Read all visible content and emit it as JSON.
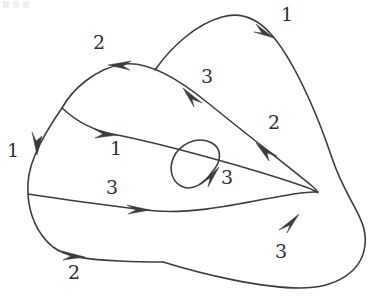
{
  "figure": {
    "kind": "knot-diagram",
    "background_color": "#ffffff",
    "stroke_color": "#3c3c41",
    "label_color": "#2f2f34",
    "width": 374,
    "height": 297
  },
  "labels": [
    {
      "id": "label-top-right-1",
      "text": "1",
      "x": 281,
      "y": 5
    },
    {
      "id": "label-top-left-2",
      "text": "2",
      "x": 93,
      "y": 33
    },
    {
      "id": "label-upper-mid-3",
      "text": "3",
      "x": 201,
      "y": 67
    },
    {
      "id": "label-right-2",
      "text": "2",
      "x": 268,
      "y": 113
    },
    {
      "id": "label-left-1",
      "text": "1",
      "x": 7,
      "y": 141
    },
    {
      "id": "label-mid-1",
      "text": "1",
      "x": 110,
      "y": 139
    },
    {
      "id": "label-loop-3",
      "text": "3",
      "x": 221,
      "y": 168
    },
    {
      "id": "label-lower-mid-3",
      "text": "3",
      "x": 106,
      "y": 178
    },
    {
      "id": "label-bottom-right-3",
      "text": "3",
      "x": 275,
      "y": 242
    },
    {
      "id": "label-bottom-left-2",
      "text": "2",
      "x": 68,
      "y": 263
    }
  ],
  "arcs": [
    {
      "id": "arc-outer-right-lobe",
      "description": "large outer lobe sweeping from the upper middle over the top right, down the right side and around the bottom to the lower middle crossing",
      "label_refs": [
        "label-top-right-1",
        "label-bottom-right-3"
      ]
    },
    {
      "id": "arc-top-left-lobe",
      "description": "upper left lobe from the left crossing over the top apex down to the right turnaround",
      "label_refs": [
        "label-top-left-2",
        "label-upper-mid-3",
        "label-right-2"
      ]
    },
    {
      "id": "arc-left-outer",
      "description": "outer left boundary descending from the top left crossing around the lower left to the bottom",
      "label_refs": [
        "label-left-1",
        "label-bottom-left-2"
      ]
    },
    {
      "id": "arc-middle-chord",
      "description": "inner chord running from the left crossing rightwards to the right turnaround",
      "label_refs": [
        "label-mid-1"
      ]
    },
    {
      "id": "arc-lower-chord",
      "description": "lower chord running from the lower left crossing rightwards to the right turnaround",
      "label_refs": [
        "label-lower-mid-3"
      ]
    },
    {
      "id": "arc-inner-loop",
      "description": "small tilted ellipse loop near the centre of the diagram",
      "label_refs": [
        "label-loop-3"
      ]
    }
  ],
  "arrowheads": [
    {
      "id": "arrowhead-top-right",
      "on_arc": "arc-outer-right-lobe",
      "x": 268,
      "y": 30,
      "direction": "down-right",
      "near_label": "label-top-right-1"
    },
    {
      "id": "arrowhead-top-left",
      "on_arc": "arc-top-left-lobe",
      "x": 117,
      "y": 64,
      "direction": "left",
      "near_label": "label-top-left-2"
    },
    {
      "id": "arrowhead-upper-mid",
      "on_arc": "arc-top-left-lobe",
      "x": 188,
      "y": 92,
      "direction": "up-left",
      "near_label": "label-upper-mid-3"
    },
    {
      "id": "arrowhead-left-side",
      "on_arc": "arc-left-outer",
      "x": 38,
      "y": 148,
      "direction": "down",
      "near_label": "label-left-1"
    },
    {
      "id": "arrowhead-mid-chord",
      "on_arc": "arc-middle-chord",
      "x": 108,
      "y": 132,
      "direction": "right",
      "near_label": "label-mid-1"
    },
    {
      "id": "arrowhead-right-upper",
      "on_arc": "arc-top-left-lobe",
      "x": 263,
      "y": 148,
      "direction": "up-left",
      "near_label": "label-right-2"
    },
    {
      "id": "arrowhead-inner-loop",
      "on_arc": "arc-inner-loop",
      "x": 215,
      "y": 176,
      "direction": "up-right",
      "near_label": "label-loop-3"
    },
    {
      "id": "arrowhead-lower-chord",
      "on_arc": "arc-lower-chord",
      "x": 141,
      "y": 209,
      "direction": "right",
      "near_label": "label-lower-mid-3"
    },
    {
      "id": "arrowhead-bottom-left",
      "on_arc": "arc-left-outer",
      "x": 76,
      "y": 256,
      "direction": "right",
      "near_label": "label-bottom-left-2"
    },
    {
      "id": "arrowhead-bottom-right",
      "on_arc": "arc-outer-right-lobe",
      "x": 292,
      "y": 220,
      "direction": "up-right",
      "near_label": "label-bottom-right-3"
    }
  ],
  "crossings": [
    {
      "id": "crossing-top-middle",
      "x": 155,
      "y": 70
    },
    {
      "id": "crossing-upper-left",
      "x": 62,
      "y": 108
    },
    {
      "id": "crossing-lower-left",
      "x": 28,
      "y": 194
    },
    {
      "id": "crossing-right-turnaround",
      "x": 317,
      "y": 192
    },
    {
      "id": "crossing-bottom-middle",
      "x": 163,
      "y": 262
    }
  ]
}
